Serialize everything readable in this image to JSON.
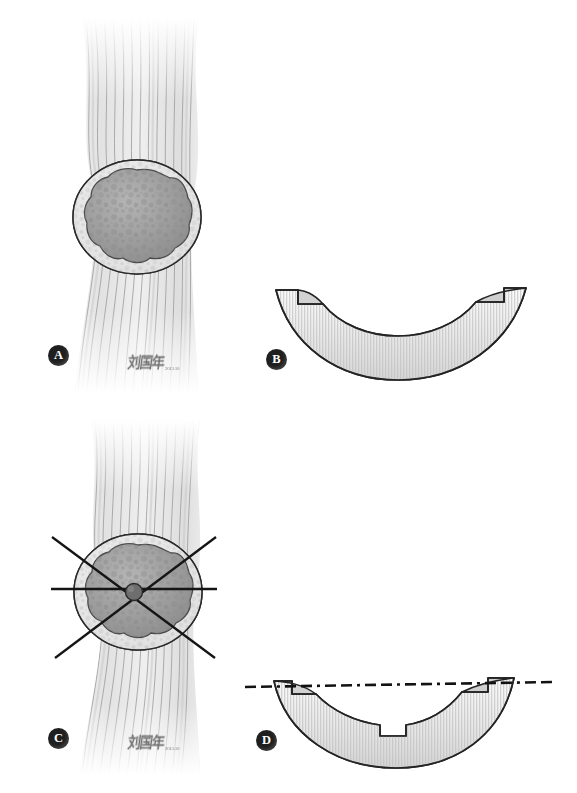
{
  "figure": {
    "background_color": "#ffffff",
    "ink_color": "#201f1f",
    "panel_count": 4
  },
  "panels": [
    {
      "id": "A",
      "label": "A",
      "view": "longitudinal",
      "description": "Tendon with striated longitudinal fibers enclosing an oval nodular mass: outer smooth capsule, mottled granular ring, dark lobulated core",
      "colors": {
        "fiber_light": "#f4f4f4",
        "fiber_line": "#8c8c8c",
        "capsule_fill": "#e8e8e8",
        "granular_ring": "#d5d5d5",
        "core_fill": "#9c9c9c",
        "outline": "#2a2a2a"
      },
      "annotations": []
    },
    {
      "id": "B",
      "label": "B",
      "view": "cross-section",
      "description": "Crescent (meniscus) shaped resected specimen with fine vertical striations and a small rectangular step notch at each upper end",
      "colors": {
        "fill_light": "#fbfbfb",
        "fill_shadow": "#d8d8d8",
        "striation": "#bdbdbd",
        "outline": "#232323"
      },
      "annotations": []
    },
    {
      "id": "C",
      "label": "C",
      "view": "longitudinal with planning lines",
      "description": "Same tendon and nodular mass as A, overlaid with one horizontal axis line, two crossing oblique lines and a small solid circle marking the centre point",
      "colors": {
        "line": "#1c1c1c",
        "center_dot": "#4a4a4a"
      },
      "annotations": [
        {
          "name": "horizontal-axis-line",
          "type": "solid"
        },
        {
          "name": "oblique-line-down-right",
          "type": "solid"
        },
        {
          "name": "oblique-line-down-left",
          "type": "solid"
        },
        {
          "name": "center-point-marker",
          "type": "filled-circle"
        }
      ]
    },
    {
      "id": "D",
      "label": "D",
      "view": "cross-section with reference line",
      "description": "Crescent specimen as in B with a horizontal dash-dot reference line across the upper ends and a rectangular wedge removed from the inner concave border",
      "colors": {
        "fill_light": "#fbfbfb",
        "fill_shadow": "#d8d8d8",
        "striation": "#bdbdbd",
        "outline": "#232323",
        "reference_line": "#141414"
      },
      "annotations": [
        {
          "name": "reference-line",
          "type": "dash-dot"
        },
        {
          "name": "central-wedge-notch",
          "type": "cut-out"
        }
      ]
    }
  ],
  "badges": {
    "a": "A",
    "b": "B",
    "c": "C",
    "d": "D"
  },
  "signatures": [
    {
      "id": "signature-a",
      "name": "刘国年",
      "date": "2013.10"
    },
    {
      "id": "signature-c",
      "name": "刘国年",
      "date": "2013.10"
    }
  ]
}
